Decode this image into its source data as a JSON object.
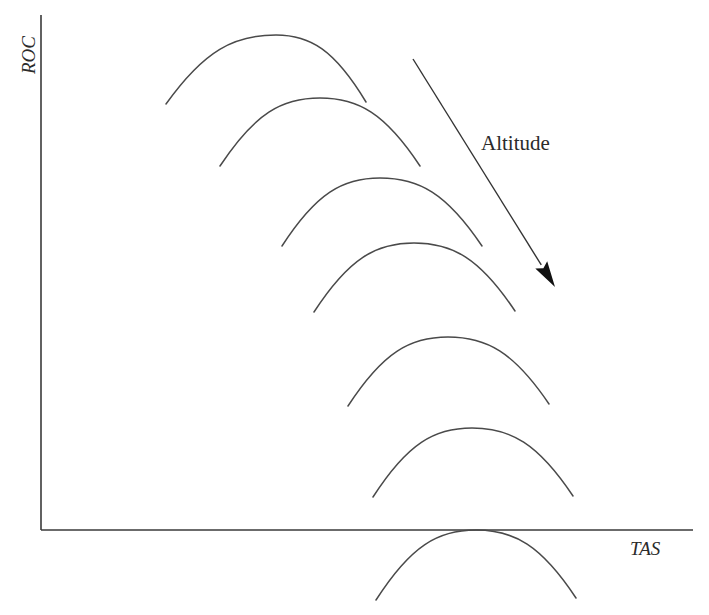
{
  "diagram": {
    "y_axis_label": "ROC",
    "x_axis_label": "TAS",
    "arrow_label": "Altitude",
    "colors": {
      "background": "#ffffff",
      "axis": "#3a3a3a",
      "curve": "#4a4a4a",
      "arrow": "#111111",
      "text": "#2b2b2b"
    },
    "axes": {
      "origin": [
        41,
        530
      ],
      "y_top": [
        41,
        15
      ],
      "x_right": [
        693,
        530
      ]
    },
    "arrow": {
      "from": [
        413,
        59
      ],
      "to": [
        555,
        287
      ]
    },
    "curves": [
      {
        "start": [
          166,
          104
        ],
        "peak": [
          276,
          35
        ],
        "end": [
          366,
          102
        ]
      },
      {
        "start": [
          220,
          166
        ],
        "peak": [
          320,
          98
        ],
        "end": [
          420,
          166
        ]
      },
      {
        "start": [
          282,
          246
        ],
        "peak": [
          380,
          178
        ],
        "end": [
          482,
          246
        ]
      },
      {
        "start": [
          314,
          312
        ],
        "peak": [
          414,
          243
        ],
        "end": [
          515,
          311
        ]
      },
      {
        "start": [
          348,
          406
        ],
        "peak": [
          448,
          337
        ],
        "end": [
          549,
          404
        ]
      },
      {
        "start": [
          373,
          497
        ],
        "peak": [
          472,
          428
        ],
        "end": [
          573,
          496
        ]
      },
      {
        "start": [
          376,
          600
        ],
        "peak": [
          476,
          530
        ],
        "end": [
          576,
          598
        ]
      }
    ]
  }
}
